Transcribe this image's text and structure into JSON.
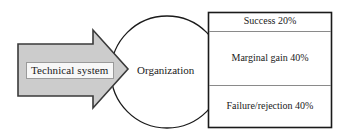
{
  "figure": {
    "type": "process-flow-diagram",
    "background_color": "#ffffff",
    "line_color": "#1a1a1a",
    "arrow_fill_color": "#cccccc"
  },
  "arrow": {
    "label": "Technical system",
    "icon": "right-arrow-icon",
    "fill": "#cccccc",
    "stroke": "#3a3a3a"
  },
  "circle": {
    "label": "Organization",
    "fill": "#ffffff",
    "stroke": "#1a1a1a"
  },
  "outcomes_table": {
    "border_color": "#1a1a1a",
    "divider_color": "#8a8a8a",
    "rows": [
      {
        "label": "Success 20%",
        "outcome": "Success",
        "percent": "20%"
      },
      {
        "label": "Marginal gain 40%",
        "outcome": "Marginal gain",
        "percent": "40%"
      },
      {
        "label": "Failure/rejection 40%",
        "outcome": "Failure/rejection",
        "percent": "40%"
      }
    ]
  }
}
